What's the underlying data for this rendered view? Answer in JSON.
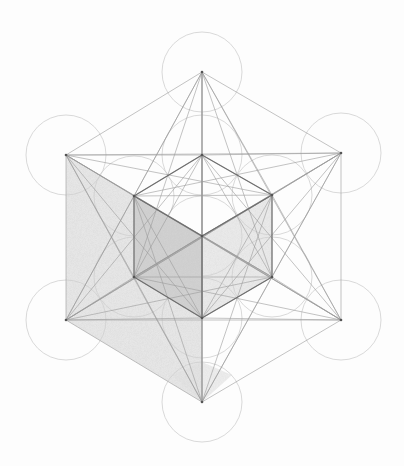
{
  "figure": {
    "colors": {
      "background": "#fdfdfd",
      "circle_stroke": "#cfcfcf",
      "line_stroke": "#9a9a9a",
      "cube_edge": "#6e6e6e",
      "shade_light": "#e6e6e6",
      "shade_dark": "#d2d2d2"
    },
    "circle_radius": 40,
    "center": [
      202,
      236
    ],
    "inner_hexagon": [
      [
        202,
        155
      ],
      [
        272,
        195
      ],
      [
        272,
        277
      ],
      [
        202,
        318
      ],
      [
        134,
        277
      ],
      [
        134,
        196
      ]
    ],
    "outer_hexagon": [
      [
        202,
        72
      ],
      [
        341,
        153
      ],
      [
        341,
        320
      ],
      [
        202,
        402
      ],
      [
        66,
        320
      ],
      [
        66,
        155
      ]
    ]
  }
}
